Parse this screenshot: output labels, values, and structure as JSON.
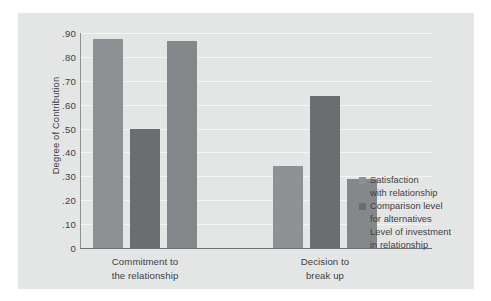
{
  "chart_data": {
    "type": "bar",
    "title": "",
    "xlabel": "",
    "ylabel": "Degree of Contribution",
    "ylim": [
      0,
      0.9
    ],
    "ytick_labels": [
      "0",
      ".10",
      ".20",
      ".30",
      ".40",
      ".50",
      ".60",
      ".70",
      ".80",
      ".90"
    ],
    "ytick_values": [
      0,
      0.1,
      0.2,
      0.3,
      0.4,
      0.5,
      0.6,
      0.7,
      0.8,
      0.9
    ],
    "grid": true,
    "legend_position": "right",
    "categories": [
      "Commitment to the relationship",
      "Decision to break up"
    ],
    "category_lines": [
      [
        "Commitment to",
        "the relationship"
      ],
      [
        "Decision to",
        "break up"
      ]
    ],
    "series": [
      {
        "name": "Satisfaction with relationship",
        "name_lines": [
          "Satisfaction",
          "with relationship"
        ],
        "color": "#8e9194",
        "values": [
          0.875,
          0.345
        ]
      },
      {
        "name": "Comparison level for alternatives",
        "name_lines": [
          "Comparison level",
          "for alternatives"
        ],
        "color": "#6b6e71",
        "values": [
          0.5,
          0.635
        ]
      },
      {
        "name": "Level of investment in relationship",
        "name_lines": [
          "Level of investment",
          "in relationship"
        ],
        "color": "#85888b",
        "values": [
          0.865,
          0.29
        ]
      }
    ]
  },
  "colors": {
    "figure_background": "#ffffff",
    "panel_background": "#e4e5e5",
    "gridline": "#f3f4f4",
    "axis_line": "#6f7276",
    "text": "#3f4144"
  }
}
